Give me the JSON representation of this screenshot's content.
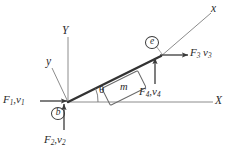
{
  "figure": {
    "type": "physics-free-body-diagram",
    "background_color": "#ffffff",
    "stroke_color": "#4a4a4a",
    "bold_stroke_color": "#2f2f2f",
    "text_color": "#2a2a2a"
  },
  "axes": {
    "global_x_label": "X",
    "global_y_label": "Y",
    "local_x_label": "x",
    "local_y_label": "y",
    "angle_label": "θ"
  },
  "nodes": [
    {
      "id": "b",
      "label": "b",
      "position": "origin"
    },
    {
      "id": "e",
      "label": "e",
      "position": "upper-right-on-incline"
    }
  ],
  "mass": {
    "label": "m"
  },
  "forces": [
    {
      "id": "F1",
      "f": "F",
      "f_sub": "1",
      "v": "v",
      "v_sub": "1",
      "separator": ",",
      "direction": "right",
      "at_node": "b"
    },
    {
      "id": "F2",
      "f": "F",
      "f_sub": "2",
      "v": "v",
      "v_sub": "2",
      "separator": ",",
      "direction": "up",
      "at_node": "b"
    },
    {
      "id": "F3",
      "f": "F",
      "f_sub": "3",
      "v": "v",
      "v_sub": "3",
      "separator": " ",
      "direction": "right",
      "at_node": "e"
    },
    {
      "id": "F4",
      "f": "F",
      "f_sub": "4",
      "v": "v",
      "v_sub": "4",
      "separator": ",",
      "direction": "up",
      "at_node": "e"
    }
  ]
}
